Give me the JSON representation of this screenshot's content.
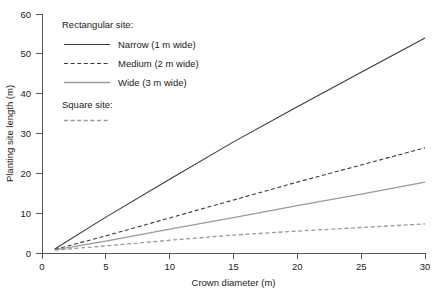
{
  "chart_data": {
    "type": "line",
    "title": "",
    "xlabel": "Crown diameter (m)",
    "ylabel": "Planting site length (m)",
    "xlim": [
      0,
      30
    ],
    "ylim": [
      0,
      60
    ],
    "xticks": [
      0,
      5,
      10,
      15,
      20,
      25,
      30
    ],
    "yticks": [
      0,
      10,
      20,
      30,
      40,
      50,
      60
    ],
    "grid": false,
    "legend_position": "upper-left-inside",
    "x": [
      1,
      5,
      10,
      15,
      20,
      25,
      30
    ],
    "series": [
      {
        "name": "Narrow (1 m wide)",
        "group": "Rectangular site:",
        "style": "solid",
        "color": "#3a3a3a",
        "values": [
          1.0,
          9.0,
          18.5,
          27.9,
          36.7,
          45.4,
          54.0
        ]
      },
      {
        "name": "Medium (2 m wide)",
        "group": "Rectangular site:",
        "style": "dashed",
        "color": "#3a3a3a",
        "values": [
          0.9,
          4.3,
          8.8,
          13.3,
          17.8,
          22.1,
          26.4
        ]
      },
      {
        "name": "Wide (3 m wide)",
        "group": "Rectangular site:",
        "style": "solid",
        "color": "#9a9a9a",
        "values": [
          0.8,
          3.0,
          6.0,
          8.9,
          11.9,
          14.8,
          17.8
        ]
      },
      {
        "name": "Square site",
        "group": "Square site:",
        "style": "dashed",
        "color": "#9a9a9a",
        "values": [
          0.7,
          1.8,
          3.2,
          4.5,
          5.5,
          6.4,
          7.3
        ]
      }
    ],
    "legend": {
      "group_rectangular": "Rectangular site:",
      "group_square": "Square site:",
      "entries": [
        {
          "label": "Narrow (1 m wide)",
          "style": "solid",
          "color": "#3a3a3a"
        },
        {
          "label": "Medium (2 m wide)",
          "style": "dashed",
          "color": "#3a3a3a"
        },
        {
          "label": "Wide (3 m wide)",
          "style": "solid",
          "color": "#9a9a9a"
        }
      ],
      "square_entry": {
        "label": "",
        "style": "dashed",
        "color": "#9a9a9a"
      }
    }
  },
  "axes": {
    "y": {
      "label": "Planting site length (m)",
      "ticks": [
        "0",
        "10",
        "20",
        "30",
        "40",
        "50",
        "60"
      ]
    },
    "x": {
      "label": "Crown diameter (m)",
      "ticks": [
        "0",
        "5",
        "10",
        "15",
        "20",
        "25",
        "30"
      ]
    }
  }
}
